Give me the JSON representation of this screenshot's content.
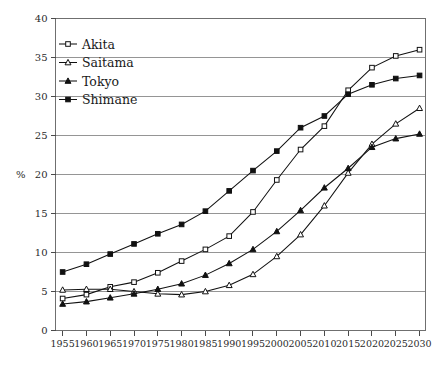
{
  "chart_data": {
    "type": "line",
    "title": "",
    "xlabel": "",
    "ylabel": "%",
    "ylim": [
      0,
      40
    ],
    "ytick_values": [
      0,
      5,
      10,
      15,
      20,
      25,
      30,
      35,
      40
    ],
    "ytick_labels": [
      "0",
      "5",
      "10",
      "15",
      "20",
      "25",
      "30",
      "35",
      "40"
    ],
    "grid": "horizontal",
    "legend_position": "top-left",
    "categories": [
      1955,
      1960,
      1965,
      1970,
      1975,
      1980,
      1985,
      1990,
      1995,
      2000,
      2005,
      2010,
      2015,
      2020,
      2025,
      2030
    ],
    "xtick_labels": [
      "1955",
      "1960",
      "1965",
      "1970",
      "1975",
      "1980",
      "1985",
      "1990",
      "1995",
      "2000",
      "2005",
      "2010",
      "2015",
      "2020",
      "2025",
      "2030"
    ],
    "series": [
      {
        "name": "Akita",
        "marker": "open-square",
        "values": [
          4.1,
          4.6,
          5.6,
          6.2,
          7.4,
          8.9,
          10.4,
          12.1,
          15.2,
          19.3,
          23.2,
          26.2,
          30.8,
          33.7,
          35.2,
          36.0
        ]
      },
      {
        "name": "Saitama",
        "marker": "open-triangle",
        "values": [
          5.2,
          5.3,
          5.3,
          5.0,
          4.7,
          4.6,
          5.0,
          5.8,
          7.2,
          9.5,
          12.3,
          16.0,
          20.2,
          23.9,
          26.5,
          28.5
        ]
      },
      {
        "name": "Tokyo",
        "marker": "filled-triangle",
        "values": [
          3.4,
          3.7,
          4.2,
          4.7,
          5.3,
          6.0,
          7.1,
          8.6,
          10.4,
          12.7,
          15.4,
          18.3,
          20.8,
          23.5,
          24.6,
          25.2
        ]
      },
      {
        "name": "Shimane",
        "marker": "filled-square",
        "values": [
          7.5,
          8.5,
          9.8,
          11.1,
          12.4,
          13.6,
          15.3,
          17.9,
          20.5,
          23.0,
          26.0,
          27.5,
          30.3,
          31.5,
          32.3,
          32.7
        ]
      }
    ]
  },
  "legend": {
    "items": [
      {
        "label": "Akita",
        "marker": "open-square"
      },
      {
        "label": "Saitama",
        "marker": "open-triangle"
      },
      {
        "label": "Tokyo",
        "marker": "filled-triangle"
      },
      {
        "label": "Shimane",
        "marker": "filled-square"
      }
    ]
  },
  "colors": {
    "series_stroke": "#111111",
    "grid": "#8a8a8a",
    "frame": "#6f6f6f",
    "text": "#1a1a1a",
    "background": "#ffffff"
  }
}
